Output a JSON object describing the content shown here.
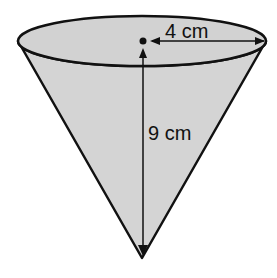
{
  "diagram": {
    "shape": "cone",
    "orientation": "inverted",
    "labels": {
      "radius": "4 cm",
      "height": "9 cm"
    },
    "colors": {
      "fill": "#d4d4d4",
      "stroke": "#111111",
      "background": "#ffffff"
    }
  }
}
